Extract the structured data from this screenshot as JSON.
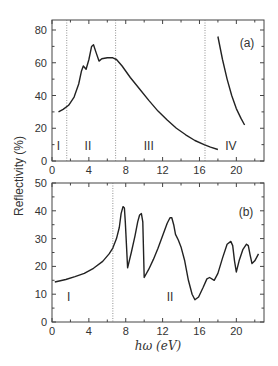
{
  "chart_data": [
    {
      "panel": "(a)",
      "type": "line",
      "title": "",
      "xlabel": "hω (eV)",
      "ylabel": "Reflectivity (%)",
      "xlim": [
        0,
        23
      ],
      "ylim": [
        0,
        85
      ],
      "xticks": [
        0,
        4,
        8,
        12,
        16,
        20
      ],
      "yticks": [
        0,
        20,
        40,
        60,
        80
      ],
      "grid": false,
      "vlines_dotted": [
        1.6,
        6.9,
        16.6
      ],
      "regions": [
        {
          "label": "I",
          "x": 0.7,
          "y": 9
        },
        {
          "label": "II",
          "x": 3.9,
          "y": 9
        },
        {
          "label": "III",
          "x": 10.5,
          "y": 9
        },
        {
          "label": "IV",
          "x": 19.4,
          "y": 9
        }
      ],
      "series": [
        {
          "name": "regions I-III",
          "x": [
            0.7,
            1.2,
            1.8,
            2.4,
            2.9,
            3.2,
            3.4,
            3.7,
            4.0,
            4.3,
            4.5,
            4.8,
            5.1,
            5.4,
            6.0,
            6.6,
            7.0,
            7.6,
            8.5,
            9.5,
            10.5,
            11.5,
            12.5,
            13.5,
            14.5,
            15.5,
            16.5,
            17.2,
            18.0
          ],
          "y": [
            30,
            31.5,
            34,
            39,
            47,
            55,
            58,
            56,
            62,
            70,
            71,
            66,
            61,
            62.5,
            63,
            63,
            62,
            58,
            51,
            44,
            37,
            30.5,
            25,
            20,
            16,
            12.5,
            10,
            8.5,
            7
          ]
        },
        {
          "name": "region IV",
          "x": [
            18.0,
            18.5,
            19.0,
            19.5,
            20.0,
            20.5,
            20.9
          ],
          "y": [
            76,
            62,
            50,
            40,
            32,
            26,
            22
          ]
        }
      ]
    },
    {
      "panel": "(b)",
      "type": "line",
      "title": "",
      "xlabel": "hω (eV)",
      "ylabel": "Reflectivity (%)",
      "xlim": [
        0,
        23
      ],
      "ylim": [
        0,
        50
      ],
      "xticks": [
        0,
        4,
        8,
        12,
        16,
        20
      ],
      "yticks": [
        0,
        10,
        20,
        30,
        40,
        50
      ],
      "grid": false,
      "vlines_dotted": [
        6.6
      ],
      "regions": [
        {
          "label": "I",
          "x": 1.8,
          "y": 9
        },
        {
          "label": "II",
          "x": 12.8,
          "y": 9
        }
      ],
      "series": [
        {
          "name": "reflectivity",
          "x": [
            0.3,
            1.5,
            2.5,
            3.5,
            4.5,
            5.5,
            6.2,
            6.6,
            7.0,
            7.3,
            7.5,
            7.7,
            7.85,
            7.95,
            8.2,
            8.6,
            9.0,
            9.3,
            9.5,
            9.7,
            9.85,
            10.0,
            10.5,
            11.0,
            11.5,
            12.0,
            12.5,
            12.8,
            13.0,
            13.2,
            13.4,
            13.7,
            14.0,
            14.4,
            14.8,
            15.2,
            15.5,
            15.9,
            16.4,
            16.8,
            17.1,
            17.6,
            18.0,
            18.5,
            19.0,
            19.4,
            19.6,
            19.8,
            20.0,
            20.3,
            20.7,
            21.1,
            21.3,
            21.5,
            21.7,
            22.0,
            22.4
          ],
          "y": [
            14.4,
            15.3,
            16.3,
            17.5,
            19.3,
            21.8,
            24.5,
            26.6,
            30,
            34,
            39,
            41.5,
            41,
            36,
            19.5,
            25,
            31,
            36,
            38.5,
            39,
            36,
            16,
            19,
            22.5,
            26.5,
            31,
            35.5,
            37.5,
            37.5,
            35,
            31.5,
            29.5,
            27,
            22,
            15,
            10,
            8,
            9,
            12.5,
            15.5,
            16,
            15,
            17.5,
            23,
            28,
            29,
            27.5,
            22,
            18,
            22,
            26,
            28,
            27.5,
            24,
            21,
            22,
            24.5
          ]
        }
      ]
    }
  ],
  "labels": {
    "ylabel": "Reflectivity (%)",
    "xlabel": "hω (eV)",
    "panel_a": "(a)",
    "panel_b": "(b)"
  }
}
